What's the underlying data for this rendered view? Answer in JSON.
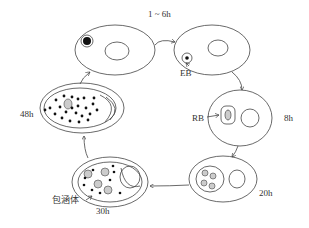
{
  "diagram": {
    "type": "cycle",
    "stages": [
      {
        "id": "stage-0h",
        "time_label": "",
        "description": "infected cell with EB entering (top-left)"
      },
      {
        "id": "stage-1-6h",
        "time_label": "1 ~ 6h",
        "inner_label": "EB"
      },
      {
        "id": "stage-8h",
        "time_label": "8h",
        "inner_label": "RB"
      },
      {
        "id": "stage-20h",
        "time_label": "20h"
      },
      {
        "id": "stage-30h",
        "time_label": "30h",
        "inner_label": "包涵体"
      },
      {
        "id": "stage-48h",
        "time_label": "48h"
      }
    ],
    "labels": {
      "t1": "1 ~ 6h",
      "eb": "EB",
      "rb": "RB",
      "t8": "8h",
      "t20": "20h",
      "t30": "30h",
      "inclusion": "包涵体",
      "t48": "48h"
    },
    "colors": {
      "line": "#444444",
      "dot": "#111111",
      "body_fill": "#d0d0d0",
      "background": "#ffffff"
    }
  }
}
